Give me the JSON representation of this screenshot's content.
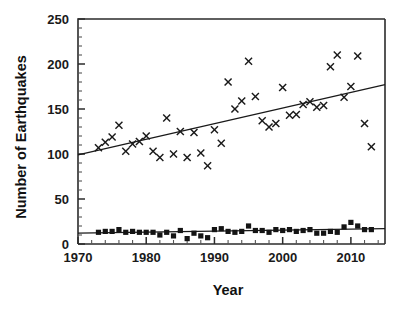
{
  "chart_data": {
    "type": "scatter",
    "title": "",
    "xlabel": "Year",
    "ylabel": "Number of Earthquakes",
    "xlim": [
      1970,
      2015
    ],
    "ylim": [
      0,
      250
    ],
    "grid": false,
    "legend": "none",
    "x_ticks": [
      1970,
      1980,
      1990,
      2000,
      2010
    ],
    "x_tick_labels": [
      "1970",
      "1980",
      "1990",
      "2000",
      "2010"
    ],
    "x_minor_step": 2,
    "y_ticks": [
      0,
      50,
      100,
      150,
      200,
      250
    ],
    "y_tick_labels": [
      "0",
      "50",
      "100",
      "150",
      "200",
      "250"
    ],
    "y_minor_step": 10,
    "series": [
      {
        "name": "large-earthquakes-cross",
        "marker": "x",
        "color": "#1a1a1a",
        "x": [
          1973,
          1974,
          1975,
          1976,
          1977,
          1978,
          1979,
          1980,
          1981,
          1982,
          1983,
          1984,
          1985,
          1986,
          1987,
          1988,
          1989,
          1990,
          1991,
          1992,
          1993,
          1994,
          1995,
          1996,
          1997,
          1998,
          1999,
          2000,
          2001,
          2002,
          2003,
          2004,
          2005,
          2006,
          2007,
          2008,
          2009,
          2010,
          2011,
          2012,
          2013
        ],
        "values": [
          107,
          113,
          119,
          132,
          103,
          111,
          114,
          120,
          103,
          96,
          140,
          100,
          125,
          96,
          124,
          101,
          87,
          127,
          112,
          180,
          150,
          159,
          203,
          164,
          137,
          130,
          134,
          174,
          143,
          144,
          155,
          158,
          152,
          154,
          197,
          210,
          163,
          175,
          209,
          134,
          108
        ]
      },
      {
        "name": "great-earthquakes-square",
        "marker": "s",
        "color": "#141414",
        "x": [
          1973,
          1974,
          1975,
          1976,
          1977,
          1978,
          1979,
          1980,
          1981,
          1982,
          1983,
          1984,
          1985,
          1986,
          1987,
          1988,
          1989,
          1990,
          1991,
          1992,
          1993,
          1994,
          1995,
          1996,
          1997,
          1998,
          1999,
          2000,
          2001,
          2002,
          2003,
          2004,
          2005,
          2006,
          2007,
          2008,
          2009,
          2010,
          2011,
          2012,
          2013
        ],
        "values": [
          13,
          14,
          14,
          16,
          13,
          14,
          13,
          13,
          13,
          10,
          13,
          9,
          15,
          6,
          12,
          9,
          7,
          16,
          17,
          14,
          13,
          14,
          20,
          15,
          15,
          13,
          16,
          15,
          16,
          14,
          15,
          16,
          12,
          12,
          14,
          13,
          19,
          24,
          20,
          16,
          16
        ]
      }
    ],
    "trendlines": [
      {
        "name": "cross-trend",
        "x": [
          1970,
          2015
        ],
        "y": [
          99,
          177
        ]
      },
      {
        "name": "square-trend",
        "x": [
          1970,
          2015
        ],
        "y": [
          12,
          17
        ]
      }
    ]
  }
}
